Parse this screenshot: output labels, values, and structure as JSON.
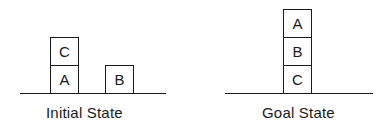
{
  "diagram": {
    "initial_state": {
      "caption": "Initial State",
      "stacks": [
        {
          "position": "left",
          "blocks_bottom_to_top": [
            "A",
            "C"
          ]
        },
        {
          "position": "right",
          "blocks_bottom_to_top": [
            "B"
          ]
        }
      ],
      "blocks": {
        "C": "C",
        "A": "A",
        "B": "B"
      }
    },
    "goal_state": {
      "caption": "Goal State",
      "stacks": [
        {
          "position": "center",
          "blocks_bottom_to_top": [
            "C",
            "B",
            "A"
          ]
        }
      ],
      "blocks": {
        "A": "A",
        "B": "B",
        "C": "C"
      }
    },
    "colors": {
      "line": "#1a1a1a",
      "background": "#ffffff"
    }
  }
}
